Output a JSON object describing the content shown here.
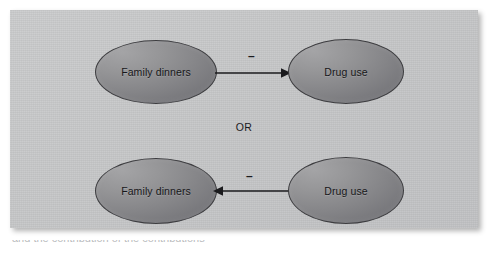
{
  "figure": {
    "type": "causal-direction-diagram",
    "panel_background": "#c4c5c6",
    "node_fill_light": "#a4a4a6",
    "node_fill_dark": "#6c6c70",
    "node_outline": "#3d3d40",
    "edge_color": "#1b1b1e",
    "text_color": "#17171a",
    "or_label": "OR",
    "caption_partial": "and the contribution of the contributions"
  },
  "rows": [
    {
      "id": "row-top",
      "source": {
        "label": "Family dinners"
      },
      "target": {
        "label": "Drug use"
      },
      "edge": {
        "sign": "–",
        "direction": "right"
      }
    },
    {
      "id": "row-bottom",
      "source": {
        "label": "Drug use"
      },
      "target": {
        "label": "Family dinners"
      },
      "edge": {
        "sign": "–",
        "direction": "left"
      }
    }
  ],
  "nodes": {
    "top_left_label": "Family dinners",
    "top_right_label": "Drug use",
    "bottom_left_label": "Family dinners",
    "bottom_right_label": "Drug use"
  },
  "signs": {
    "top": "–",
    "bottom": "–"
  }
}
